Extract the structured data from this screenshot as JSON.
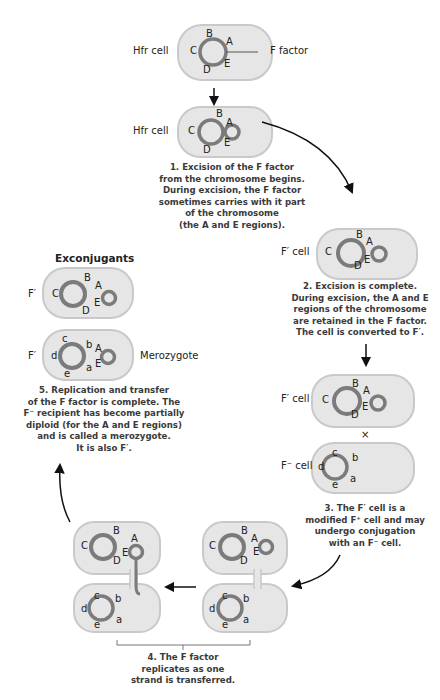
{
  "figure": {
    "colors": {
      "cell_fill": "#e6e6e6",
      "cell_outline": "#c9c9c9",
      "chromosome": "#7b7b7b",
      "text": "#222222",
      "caption_text": "#3a3a3a",
      "arrow": "#111111"
    }
  },
  "panel_hfr": {
    "cell_label": "Hfr cell",
    "pointer_label": "F factor",
    "genes": [
      "B",
      "A",
      "C",
      "E",
      "D"
    ]
  },
  "panel_excision": {
    "cell_label": "Hfr cell",
    "genes": [
      "B",
      "A",
      "C",
      "E",
      "D"
    ],
    "caption": [
      "1. Excision of the F factor",
      "from the chromosome begins.",
      "During excision, the F factor",
      "sometimes carries with it part",
      "of the chromosome",
      "(the A and E regions)."
    ]
  },
  "panel_fprime": {
    "cell_label": "F′ cell",
    "genes": [
      "B",
      "A",
      "C",
      "E",
      "D"
    ],
    "caption": [
      "2. Excision is complete.",
      "During excision, the A and E",
      "regions of the chromosome",
      "are retained in the F factor.",
      "The cell is converted to F′."
    ]
  },
  "panel_cross": {
    "donor_label": "F′ cell",
    "cross_symbol": "×",
    "recipient_label": "F⁻ cell",
    "donor_genes": [
      "B",
      "A",
      "C",
      "E",
      "D"
    ],
    "recipient_genes": [
      "c",
      "b",
      "d",
      "a",
      "e"
    ],
    "caption": [
      "3. The F′ cell is a",
      "modified F⁺ cell and may",
      "undergo conjugation",
      "with an F⁻ cell."
    ]
  },
  "panel_transfer": {
    "donor_genes": [
      "B",
      "A",
      "C",
      "E",
      "D"
    ],
    "recipient_genes": [
      "c",
      "b",
      "d",
      "a",
      "e"
    ],
    "caption": [
      "4. The F factor",
      "replicates as one",
      "strand is transferred."
    ]
  },
  "panel_exconjugants": {
    "heading": "Exconjugants",
    "top_label": "F′",
    "top_genes": [
      "B",
      "A",
      "C",
      "E",
      "D"
    ],
    "bottom_label": "F′",
    "bottom_genes": [
      "c",
      "b",
      "A",
      "d",
      "a",
      "E",
      "e"
    ],
    "side_label": "Merozygote",
    "caption": [
      "5. Replication and transfer",
      "of the F factor is complete. The",
      "F⁻ recipient has become partially",
      "diploid (for the A and E regions)",
      "and is called a merozygote.",
      "It is also F′."
    ]
  }
}
